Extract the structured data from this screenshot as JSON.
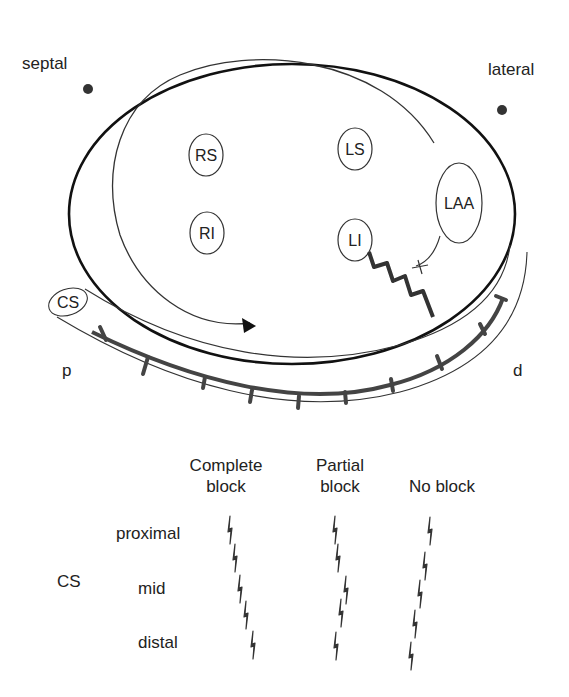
{
  "diagram": {
    "orientation_labels": {
      "septal": "septal",
      "lateral": "lateral"
    },
    "veins": [
      {
        "id": "RS",
        "label": "RS"
      },
      {
        "id": "LS",
        "label": "LS"
      },
      {
        "id": "RI",
        "label": "RI"
      },
      {
        "id": "LI",
        "label": "LI"
      },
      {
        "id": "LAA",
        "label": "LAA"
      }
    ],
    "cs_tube_label": "CS",
    "cs_ends": {
      "proximal": "p",
      "distal": "d"
    }
  },
  "legend": {
    "columns": [
      {
        "line1": "Complete",
        "line2": "block"
      },
      {
        "line1": "Partial",
        "line2": "block"
      },
      {
        "line1": "No block",
        "line2": ""
      }
    ],
    "group_label": "CS",
    "rows": [
      "proximal",
      "mid",
      "distal"
    ]
  },
  "colors": {
    "ink": "#222222",
    "catheter": "#444444",
    "background": "#ffffff"
  }
}
